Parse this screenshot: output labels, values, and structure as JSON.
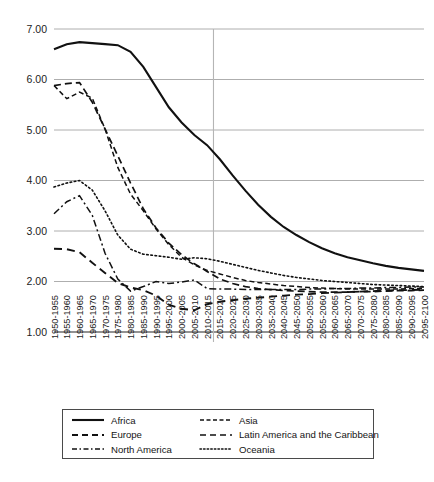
{
  "figure": {
    "caption": ""
  },
  "chart_data": {
    "type": "line",
    "title": "",
    "xlabel": "",
    "ylabel": "",
    "ylim": [
      1.0,
      7.0
    ],
    "ytick_labels": [
      "1.00",
      "2.00",
      "3.00",
      "4.00",
      "5.00",
      "6.00",
      "7.00"
    ],
    "ytick_values": [
      1.0,
      2.0,
      3.0,
      4.0,
      5.0,
      6.0,
      7.0
    ],
    "grid": true,
    "legend_position": "below-plot",
    "reference_line": {
      "x_category": "2010-2015",
      "orientation": "vertical"
    },
    "categories": [
      "1950-1955",
      "1955-1960",
      "1960-1965",
      "1965-1970",
      "1970-1975",
      "1975-1980",
      "1980-1985",
      "1985-1990",
      "1990-1995",
      "1995-2000",
      "2000-2005",
      "2005-2010",
      "2010-2015",
      "2015-2020",
      "2020-2025",
      "2025-2030",
      "2030-2035",
      "2035-2040",
      "2040-2045",
      "2045-2050",
      "2050-2055",
      "2055-2060",
      "2060-2065",
      "2065-2070",
      "2070-2075",
      "2075-2080",
      "2080-2085",
      "2085-2090",
      "2090-2095",
      "2095-2100"
    ],
    "series": [
      {
        "name": "Africa",
        "style": "solid",
        "values": [
          6.6,
          6.7,
          6.74,
          6.72,
          6.7,
          6.68,
          6.55,
          6.25,
          5.85,
          5.45,
          5.15,
          4.9,
          4.7,
          4.42,
          4.1,
          3.8,
          3.52,
          3.28,
          3.08,
          2.92,
          2.78,
          2.66,
          2.56,
          2.48,
          2.42,
          2.36,
          2.31,
          2.27,
          2.24,
          2.21
        ]
      },
      {
        "name": "Asia",
        "style": "short-dash",
        "values": [
          5.88,
          5.62,
          5.75,
          5.63,
          5.02,
          4.26,
          3.73,
          3.4,
          3.04,
          2.73,
          2.48,
          2.33,
          2.22,
          2.15,
          2.08,
          2.02,
          1.98,
          1.95,
          1.92,
          1.9,
          1.88,
          1.87,
          1.86,
          1.85,
          1.85,
          1.85,
          1.85,
          1.85,
          1.86,
          1.86
        ]
      },
      {
        "name": "Europe",
        "style": "long-dash",
        "values": [
          2.65,
          2.64,
          2.58,
          2.37,
          2.17,
          1.97,
          1.88,
          1.83,
          1.72,
          1.54,
          1.46,
          1.43,
          1.55,
          1.6,
          1.63,
          1.66,
          1.68,
          1.7,
          1.72,
          1.74,
          1.75,
          1.77,
          1.78,
          1.79,
          1.8,
          1.81,
          1.82,
          1.83,
          1.83,
          1.84
        ]
      },
      {
        "name": "Latin America and the Caribbean",
        "style": "dash",
        "values": [
          5.88,
          5.92,
          5.94,
          5.55,
          5.02,
          4.49,
          3.95,
          3.44,
          3.06,
          2.76,
          2.53,
          2.35,
          2.2,
          2.05,
          1.96,
          1.9,
          1.86,
          1.84,
          1.82,
          1.81,
          1.8,
          1.79,
          1.79,
          1.79,
          1.8,
          1.8,
          1.81,
          1.82,
          1.82,
          1.83
        ]
      },
      {
        "name": "North America",
        "style": "dash-dot",
        "values": [
          3.34,
          3.58,
          3.7,
          3.31,
          2.56,
          2.05,
          1.81,
          1.9,
          2.0,
          1.96,
          1.99,
          2.03,
          1.86,
          1.85,
          1.85,
          1.84,
          1.84,
          1.84,
          1.84,
          1.84,
          1.85,
          1.85,
          1.86,
          1.86,
          1.87,
          1.87,
          1.88,
          1.88,
          1.89,
          1.89
        ]
      },
      {
        "name": "Oceania",
        "style": "dotted",
        "values": [
          3.87,
          3.95,
          4.0,
          3.81,
          3.4,
          2.92,
          2.64,
          2.54,
          2.51,
          2.48,
          2.44,
          2.47,
          2.45,
          2.4,
          2.34,
          2.28,
          2.22,
          2.17,
          2.12,
          2.08,
          2.05,
          2.02,
          2.0,
          1.98,
          1.96,
          1.94,
          1.93,
          1.92,
          1.91,
          1.9
        ]
      }
    ]
  },
  "legend": {
    "entries": [
      {
        "label": "Africa",
        "key": "solid-line-key"
      },
      {
        "label": "Asia",
        "key": "short-dash-line-key"
      },
      {
        "label": "Europe",
        "key": "long-dash-line-key"
      },
      {
        "label": "Latin America and the Caribbean",
        "key": "dash-line-key"
      },
      {
        "label": "North America",
        "key": "dash-dot-line-key"
      },
      {
        "label": "Oceania",
        "key": "dotted-line-key"
      }
    ]
  },
  "colors": {
    "line": "#111111",
    "grid": "#aeaeae",
    "axis": "#6e6e6e",
    "background": "#ffffff"
  }
}
